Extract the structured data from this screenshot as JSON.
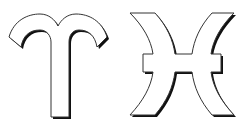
{
  "symbols": [
    {
      "name": "Aries",
      "glyph": "♈"
    },
    {
      "name": "Pisces",
      "glyph": "♓"
    }
  ],
  "colors": {
    "fill": "#ffffff",
    "outline": "#333333",
    "shadow": "#111111",
    "background": "#ffffff"
  }
}
